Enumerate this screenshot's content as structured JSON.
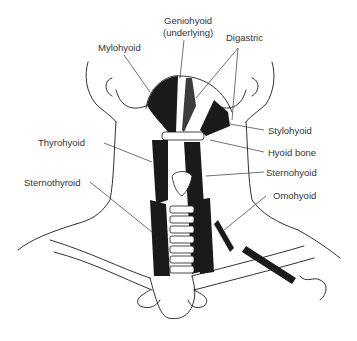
{
  "diagram": {
    "labels": {
      "geniohyoid_line1": "Geniohyoid",
      "geniohyoid_line2": "(underlying)",
      "mylohyoid": "Mylohyoid",
      "digastric": "Digastric",
      "stylohyoid": "Stylohyoid",
      "hyoid_bone": "Hyoid bone",
      "thyrohyoid": "Thyrohyoid",
      "sternohyoid": "Sternohyoid",
      "sternothyroid": "Sternothyroid",
      "omohyoid": "Omohyoid"
    },
    "colors": {
      "ink": "#1a1a1a",
      "label_text": "#333333",
      "background": "#ffffff"
    }
  }
}
